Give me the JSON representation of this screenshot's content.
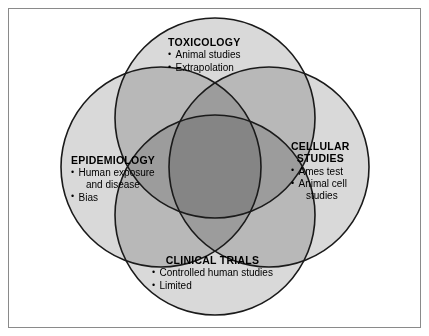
{
  "figure": {
    "type": "venn-diagram",
    "set_count": 4,
    "colors": {
      "circle_fill": "#d9d9d9",
      "circle_stroke": "#1a1a1a",
      "frame_stroke": "#8a8a8a",
      "background": "#ffffff",
      "text": "#000000",
      "pair_overlap": "#b8b8b8",
      "triple_overlap": "#6e6e6e",
      "center_overlap": "#000000"
    }
  },
  "sets": [
    {
      "id": "toxicology",
      "position": "top",
      "title": "TOXICOLOGY",
      "items": [
        "Animal studies",
        "Extrapolation"
      ]
    },
    {
      "id": "epidemiology",
      "position": "left",
      "title": "EPIDEMIOLOGY",
      "items": [
        "Human exposure and disease",
        "Bias"
      ],
      "items_wrapped": [
        {
          "line1": "Human exposure",
          "line2": "and disease"
        },
        {
          "line1": "Bias",
          "line2": ""
        }
      ]
    },
    {
      "id": "cellular",
      "position": "right",
      "title": "CELLULAR\nSTUDIES",
      "title_lines": [
        "CELLULAR",
        "STUDIES"
      ],
      "items": [
        "Ames test",
        "Animal cell studies"
      ],
      "items_wrapped": [
        {
          "line1": "Ames test",
          "line2": ""
        },
        {
          "line1": "Animal cell",
          "line2": "studies"
        }
      ]
    },
    {
      "id": "clinical",
      "position": "bottom",
      "title": "CLINICAL TRIALS",
      "items": [
        "Controlled human studies",
        "Limited"
      ]
    }
  ]
}
